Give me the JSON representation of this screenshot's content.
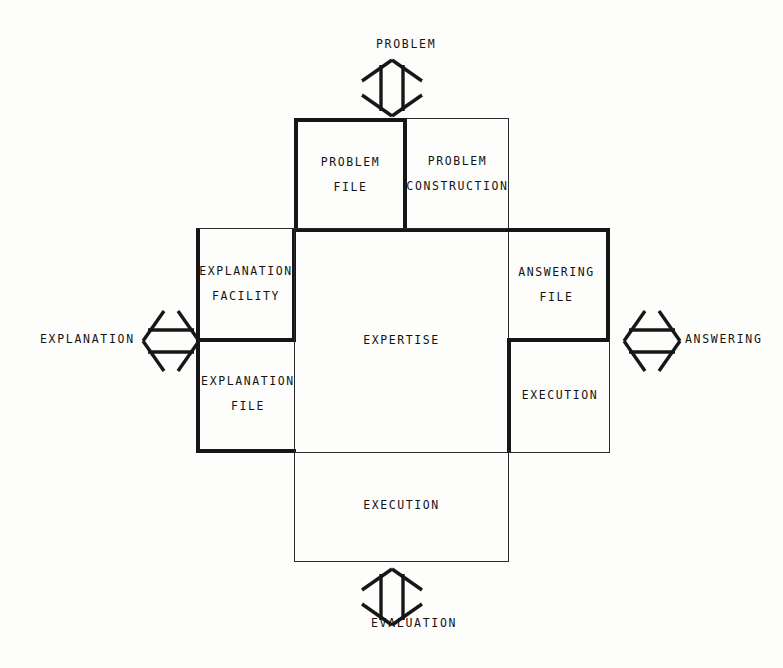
{
  "diagram": {
    "type": "block-diagram",
    "stroke_color": "#161616",
    "thin_stroke_color": "#2a2a2a",
    "background_color": "#fdfdfc",
    "external_labels": [
      {
        "name": "problem",
        "text": "PROBLEM",
        "position": "top"
      },
      {
        "name": "evaluation",
        "text": "EVALUATION",
        "position": "bottom"
      },
      {
        "name": "explanation",
        "text": "EXPLANATION",
        "position": "left"
      },
      {
        "name": "answering",
        "text": "ANSWERING",
        "position": "right"
      }
    ],
    "arrows": [
      {
        "name": "problem-arrow",
        "icon": "double-arrow-vertical-icon",
        "orientation": "vertical",
        "position": "top"
      },
      {
        "name": "evaluation-arrow",
        "icon": "double-arrow-vertical-icon",
        "orientation": "vertical",
        "position": "bottom"
      },
      {
        "name": "explanation-arrow",
        "icon": "double-arrow-horizontal-icon",
        "orientation": "horizontal",
        "position": "left"
      },
      {
        "name": "answering-arrow",
        "icon": "double-arrow-horizontal-icon",
        "orientation": "horizontal",
        "position": "right"
      }
    ],
    "cells": {
      "problem_file": {
        "line1": "PROBLEM",
        "line2": "FILE",
        "emphasis": "bold",
        "borders": "left,top,right,bottom"
      },
      "problem_construction": {
        "line1": "PROBLEM",
        "line2": "CONSTRUCTION",
        "emphasis": "thin",
        "borders": "top,right,bottom"
      },
      "explanation_facility": {
        "line1": "EXPLANATION",
        "line2": "FACILITY",
        "emphasis": "bold",
        "borders": "left,top,right,bottom"
      },
      "explanation_file": {
        "line1": "EXPLANATION",
        "line2": "FILE",
        "emphasis": "bold",
        "borders": "left,bottom"
      },
      "expertise": {
        "line1": "EXPERTISE",
        "line2": "",
        "emphasis": "thin",
        "borders": "left,top,right,bottom"
      },
      "answering_file": {
        "line1": "ANSWERING",
        "line2": "FILE",
        "emphasis": "bold",
        "borders": "top,right,bottom"
      },
      "execution_right": {
        "line1": "EXECUTION",
        "line2": "",
        "emphasis": "bold",
        "borders": "left,bottom"
      },
      "execution_bottom": {
        "line1": "EXECUTION",
        "line2": "",
        "emphasis": "thin",
        "borders": "left,right,bottom"
      }
    }
  }
}
